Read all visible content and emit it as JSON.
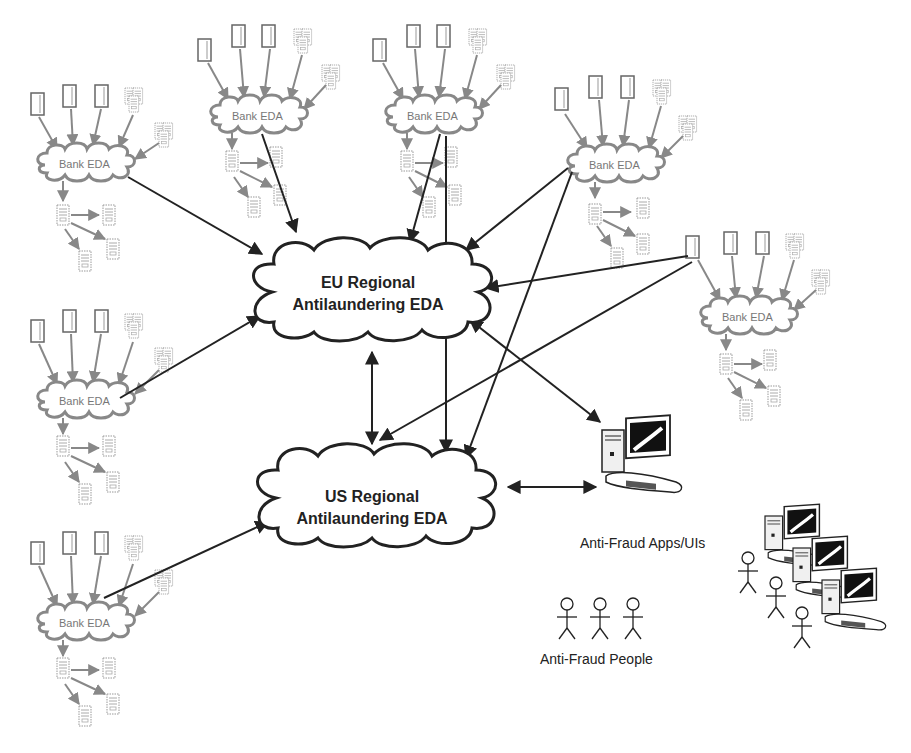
{
  "diagram": {
    "regional_hubs": [
      {
        "id": "eu",
        "line1": "EU Regional",
        "line2": "Antilaundering EDA"
      },
      {
        "id": "us",
        "line1": "US Regional",
        "line2": "Antilaundering EDA"
      }
    ],
    "bank_nodes": [
      {
        "id": "bank-left-1",
        "label": "Bank EDA"
      },
      {
        "id": "bank-top-1",
        "label": "Bank EDA"
      },
      {
        "id": "bank-top-2",
        "label": "Bank EDA"
      },
      {
        "id": "bank-right-1",
        "label": "Bank EDA"
      },
      {
        "id": "bank-right-2",
        "label": "Bank EDA"
      },
      {
        "id": "bank-left-2",
        "label": "Bank EDA"
      },
      {
        "id": "bank-left-3",
        "label": "Bank EDA"
      }
    ],
    "apps_caption": "Anti-Fraud Apps/UIs",
    "people_caption": "Anti-Fraud People",
    "icons": {
      "source": "document-icon",
      "source_cluster": "server-cluster-icon",
      "consumer": "server-icon",
      "workstation": "computer-workstation-icon",
      "person": "stick-figure-icon"
    },
    "colors": {
      "bank_stroke": "#888888",
      "hub_stroke": "#222222",
      "arrow": "#222222",
      "gray_arrow": "#888888"
    }
  }
}
